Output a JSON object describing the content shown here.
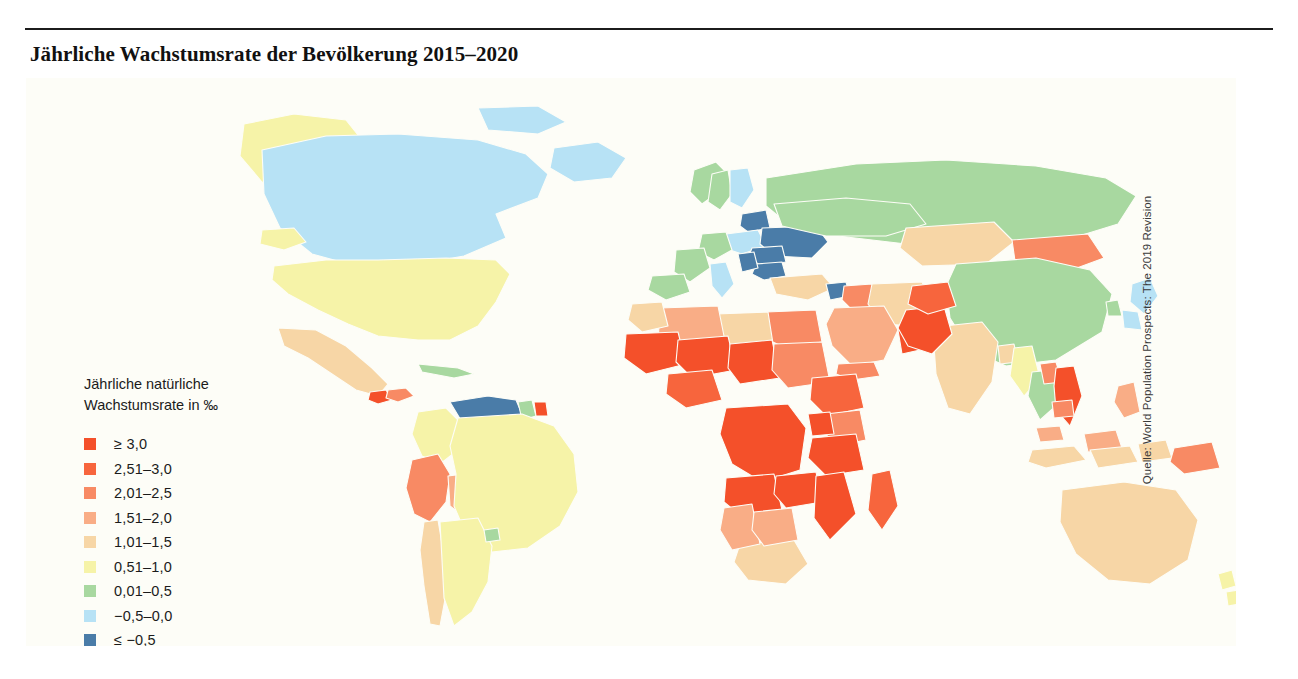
{
  "figure": {
    "title": "Jährliche Wachstumsrate der Bevölkerung 2015–2020",
    "source": "Quelle: World Population Prospects: The 2019 Revision",
    "background": "#fdfdf7"
  },
  "legend": {
    "title": "Jährliche natürliche\nWachstumsrate in ‰",
    "items": [
      {
        "label": "≥ 3,0",
        "color": "#f4502a"
      },
      {
        "label": "2,51–3,0",
        "color": "#f7653d"
      },
      {
        "label": "2,01–2,5",
        "color": "#f88a64"
      },
      {
        "label": "1,51–2,0",
        "color": "#f9ad86"
      },
      {
        "label": "1,01–1,5",
        "color": "#f7d6a6"
      },
      {
        "label": "0,51–1,0",
        "color": "#f6f3a8"
      },
      {
        "label": "0,01–0,5",
        "color": "#a8d8a0"
      },
      {
        "label": "−0,5–0,0",
        "color": "#b7e2f5"
      },
      {
        "label": "≤ −0,5",
        "color": "#4a7ca8"
      }
    ]
  },
  "chart_data": {
    "type": "heatmap",
    "title": "Jährliche Wachstumsrate der Bevölkerung 2015–2020",
    "xlabel": "",
    "ylabel": "",
    "legend_title": "Jährliche natürliche Wachstumsrate in ‰",
    "legend_position": "left-center",
    "grid": false,
    "projection": "world-choropleth",
    "bins": [
      {
        "label": "≥ 3,0",
        "min": 3.0,
        "max": null,
        "color": "#f4502a"
      },
      {
        "label": "2,51–3,0",
        "min": 2.51,
        "max": 3.0,
        "color": "#f7653d"
      },
      {
        "label": "2,01–2,5",
        "min": 2.01,
        "max": 2.5,
        "color": "#f88a64"
      },
      {
        "label": "1,51–2,0",
        "min": 1.51,
        "max": 2.0,
        "color": "#f9ad86"
      },
      {
        "label": "1,01–1,5",
        "min": 1.01,
        "max": 1.5,
        "color": "#f7d6a6"
      },
      {
        "label": "0,51–1,0",
        "min": 0.51,
        "max": 1.0,
        "color": "#f6f3a8"
      },
      {
        "label": "0,01–0,5",
        "min": 0.01,
        "max": 0.5,
        "color": "#a8d8a0"
      },
      {
        "label": "−0,5–0,0",
        "min": -0.5,
        "max": 0.0,
        "color": "#b7e2f5"
      },
      {
        "label": "≤ −0,5",
        "min": null,
        "max": -0.5,
        "color": "#4a7ca8"
      }
    ],
    "regions": [
      {
        "name": "Greenland",
        "bin": "0,51–1,0"
      },
      {
        "name": "Canada",
        "bin": "−0,5–0,0"
      },
      {
        "name": "United States",
        "bin": "0,51–1,0"
      },
      {
        "name": "Mexico",
        "bin": "1,01–1,5"
      },
      {
        "name": "Guatemala",
        "bin": "≥ 3,0"
      },
      {
        "name": "Honduras",
        "bin": "2,01–2,5"
      },
      {
        "name": "Cuba",
        "bin": "0,01–0,5"
      },
      {
        "name": "Venezuela",
        "bin": "≤ −0,5"
      },
      {
        "name": "Guyana",
        "bin": "0,01–0,5"
      },
      {
        "name": "Suriname",
        "bin": "≥ 3,0"
      },
      {
        "name": "Colombia",
        "bin": "0,51–1,0"
      },
      {
        "name": "Peru",
        "bin": "2,01–2,5"
      },
      {
        "name": "Bolivia",
        "bin": "1,51–2,0"
      },
      {
        "name": "Brazil",
        "bin": "0,51–1,0"
      },
      {
        "name": "Argentina",
        "bin": "0,51–1,0"
      },
      {
        "name": "Chile",
        "bin": "1,01–1,5"
      },
      {
        "name": "Uruguay",
        "bin": "0,01–0,5"
      },
      {
        "name": "Norway",
        "bin": "0,01–0,5"
      },
      {
        "name": "Sweden",
        "bin": "0,01–0,5"
      },
      {
        "name": "Finland",
        "bin": "−0,5–0,0"
      },
      {
        "name": "Baltics",
        "bin": "≤ −0,5"
      },
      {
        "name": "Poland",
        "bin": "−0,5–0,0"
      },
      {
        "name": "Germany",
        "bin": "0,01–0,5"
      },
      {
        "name": "France",
        "bin": "0,01–0,5"
      },
      {
        "name": "Spain",
        "bin": "0,01–0,5"
      },
      {
        "name": "Italy",
        "bin": "−0,5–0,0"
      },
      {
        "name": "Ukraine",
        "bin": "≤ −0,5"
      },
      {
        "name": "Romania",
        "bin": "≤ −0,5"
      },
      {
        "name": "Bulgaria",
        "bin": "≤ −0,5"
      },
      {
        "name": "Serbia",
        "bin": "≤ −0,5"
      },
      {
        "name": "Russia",
        "bin": "0,01–0,5"
      },
      {
        "name": "Turkey",
        "bin": "1,01–1,5"
      },
      {
        "name": "Syria",
        "bin": "≤ −0,5"
      },
      {
        "name": "Iraq",
        "bin": "2,01–2,5"
      },
      {
        "name": "Iran",
        "bin": "1,01–1,5"
      },
      {
        "name": "Saudi Arabia",
        "bin": "1,51–2,0"
      },
      {
        "name": "Oman",
        "bin": "≥ 3,0"
      },
      {
        "name": "Yemen",
        "bin": "2,01–2,5"
      },
      {
        "name": "Egypt",
        "bin": "2,01–2,5"
      },
      {
        "name": "Libya",
        "bin": "1,01–1,5"
      },
      {
        "name": "Algeria",
        "bin": "1,51–2,0"
      },
      {
        "name": "Morocco",
        "bin": "1,01–1,5"
      },
      {
        "name": "Mali",
        "bin": "≥ 3,0"
      },
      {
        "name": "Niger",
        "bin": "≥ 3,0"
      },
      {
        "name": "Chad",
        "bin": "≥ 3,0"
      },
      {
        "name": "Sudan",
        "bin": "2,01–2,5"
      },
      {
        "name": "Nigeria",
        "bin": "2,51–3,0"
      },
      {
        "name": "Ethiopia",
        "bin": "2,51–3,0"
      },
      {
        "name": "Kenya",
        "bin": "2,01–2,5"
      },
      {
        "name": "Uganda",
        "bin": "≥ 3,0"
      },
      {
        "name": "Tanzania",
        "bin": "≥ 3,0"
      },
      {
        "name": "DR Congo",
        "bin": "≥ 3,0"
      },
      {
        "name": "Angola",
        "bin": "≥ 3,0"
      },
      {
        "name": "Zambia",
        "bin": "≥ 3,0"
      },
      {
        "name": "Mozambique",
        "bin": "≥ 3,0"
      },
      {
        "name": "Madagascar",
        "bin": "2,51–3,0"
      },
      {
        "name": "South Africa",
        "bin": "1,01–1,5"
      },
      {
        "name": "Namibia",
        "bin": "1,51–2,0"
      },
      {
        "name": "Botswana",
        "bin": "1,51–2,0"
      },
      {
        "name": "Kazakhstan",
        "bin": "1,01–1,5"
      },
      {
        "name": "Mongolia",
        "bin": "2,01–2,5"
      },
      {
        "name": "China",
        "bin": "0,01–0,5"
      },
      {
        "name": "Japan",
        "bin": "−0,5–0,0"
      },
      {
        "name": "South Korea",
        "bin": "0,01–0,5"
      },
      {
        "name": "India",
        "bin": "1,01–1,5"
      },
      {
        "name": "Pakistan",
        "bin": "≥ 3,0"
      },
      {
        "name": "Afghanistan",
        "bin": "2,51–3,0"
      },
      {
        "name": "Bangladesh",
        "bin": "1,01–1,5"
      },
      {
        "name": "Myanmar",
        "bin": "0,51–1,0"
      },
      {
        "name": "Thailand",
        "bin": "0,01–0,5"
      },
      {
        "name": "Vietnam",
        "bin": "≥ 3,0"
      },
      {
        "name": "Laos",
        "bin": "2,01–2,5"
      },
      {
        "name": "Cambodia",
        "bin": "2,01–2,5"
      },
      {
        "name": "Malaysia",
        "bin": "1,51–2,0"
      },
      {
        "name": "Indonesia",
        "bin": "1,01–1,5"
      },
      {
        "name": "Philippines",
        "bin": "1,51–2,0"
      },
      {
        "name": "Papua New Guinea",
        "bin": "2,01–2,5"
      },
      {
        "name": "Australia",
        "bin": "1,01–1,5"
      },
      {
        "name": "New Zealand",
        "bin": "0,51–1,0"
      }
    ]
  }
}
